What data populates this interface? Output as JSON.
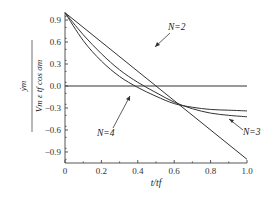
{
  "chart_data": {
    "type": "line",
    "title": "",
    "xlabel": "t/t_f",
    "ylabel": "y_m dot / (V_m ε t_f cos σ_m)",
    "xlim": [
      0,
      1.0
    ],
    "ylim": [
      -1.05,
      1.0
    ],
    "xticks": [
      "0",
      "0.2",
      "0.4",
      "0.6",
      "0.8",
      "1.0"
    ],
    "yticks": [
      "0.9",
      "0.6",
      "0.3",
      "0.0",
      "-0.3",
      "-0.6",
      "-0.9"
    ],
    "grid": false,
    "legend": "annotations",
    "x": [
      0,
      0.1,
      0.2,
      0.3,
      0.4,
      0.5,
      0.6,
      0.7,
      0.8,
      0.9,
      1.0
    ],
    "series": [
      {
        "name": "N=2",
        "values": [
          1.0,
          0.8,
          0.6,
          0.4,
          0.2,
          0.0,
          -0.2,
          -0.4,
          -0.6,
          -0.8,
          -1.0
        ]
      },
      {
        "name": "N=3",
        "values": [
          1.0,
          0.7,
          0.44,
          0.22,
          0.05,
          -0.09,
          -0.22,
          -0.31,
          -0.37,
          -0.4,
          -0.42
        ]
      },
      {
        "name": "N=4",
        "values": [
          1.0,
          0.62,
          0.34,
          0.13,
          -0.02,
          -0.14,
          -0.24,
          -0.29,
          -0.32,
          -0.33,
          -0.34
        ]
      },
      {
        "name": "zero",
        "values": [
          0,
          0,
          0,
          0,
          0,
          0,
          0,
          0,
          0,
          0,
          0
        ]
      }
    ],
    "annotations": [
      {
        "text": "N=2",
        "x": 0.58,
        "y": 0.55
      },
      {
        "text": "N=3",
        "x": 1.02,
        "y": -0.55
      },
      {
        "text": "N=4",
        "x": 0.17,
        "y": -0.7
      }
    ]
  },
  "labels": {
    "ylabel_num": "ẏm",
    "ylabel_den": "Vm ε tf cos σm",
    "xlabel": "t/tf",
    "n2": "N=2",
    "n3": "N=3",
    "n4": "N=4"
  }
}
